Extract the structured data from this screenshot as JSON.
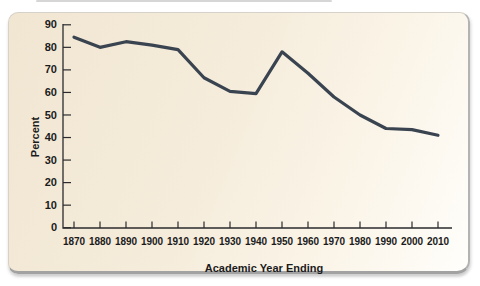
{
  "chart_data": {
    "type": "line",
    "title": "",
    "xlabel": "Academic Year Ending",
    "ylabel": "Percent",
    "x": [
      1870,
      1880,
      1890,
      1900,
      1910,
      1920,
      1930,
      1940,
      1950,
      1960,
      1970,
      1980,
      1990,
      2000,
      2010
    ],
    "values": [
      84.5,
      80,
      82.5,
      81,
      79,
      66.5,
      60.5,
      59.5,
      78,
      68.5,
      58,
      50,
      44,
      43.5,
      41
    ],
    "yticks": [
      0,
      10,
      20,
      30,
      40,
      50,
      60,
      70,
      80,
      90
    ],
    "ylim": [
      0,
      90
    ],
    "grid": false,
    "legend": "none",
    "line_color": "#3a4450",
    "axis_color": "#2b2b2e",
    "text_color": "#1b1b20",
    "card_bg_start": "#f1e6d2",
    "card_bg_end": "#fffefb"
  }
}
